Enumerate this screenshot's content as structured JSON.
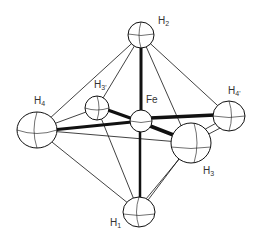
{
  "diagram": {
    "type": "molecular-structure",
    "atoms": [
      {
        "id": "H2",
        "label": "H",
        "sub": "2",
        "x": 141,
        "y": 35,
        "r": 12
      },
      {
        "id": "H3p",
        "label": "H",
        "sub": "3'",
        "x": 97,
        "y": 108,
        "r": 12
      },
      {
        "id": "Fe",
        "label": "Fe",
        "sub": "",
        "x": 141,
        "y": 121,
        "r": 11
      },
      {
        "id": "H4",
        "label": "H",
        "sub": "4",
        "x": 37,
        "y": 130,
        "r": 20
      },
      {
        "id": "H4p",
        "label": "H",
        "sub": "4'",
        "x": 229,
        "y": 116,
        "r": 16
      },
      {
        "id": "H3",
        "label": "H",
        "sub": "3",
        "x": 191,
        "y": 143,
        "r": 20
      },
      {
        "id": "H1",
        "label": "H",
        "sub": "1",
        "x": 139,
        "y": 212,
        "r": 16
      }
    ],
    "labels": {
      "H2": "H",
      "H2_sub": "2",
      "H3p": "H",
      "H3p_sub": "3'",
      "Fe": "Fe",
      "H4": "H",
      "H4_sub": "4",
      "H4p": "H",
      "H4p_sub": "4'",
      "H3": "H",
      "H3_sub": "3",
      "H1": "H",
      "H1_sub": "1"
    },
    "colors": {
      "line": "#111111",
      "atom_fill": "#ffffff",
      "label": "#333333"
    }
  }
}
